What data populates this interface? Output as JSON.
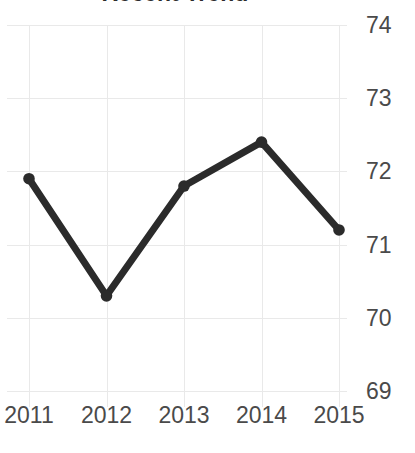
{
  "chart_data": {
    "type": "line",
    "title": "Recent Trend",
    "xlabel": "",
    "ylabel": "",
    "categories": [
      "2011",
      "2012",
      "2013",
      "2014",
      "2015"
    ],
    "values": [
      71.9,
      70.3,
      71.8,
      72.4,
      71.2
    ],
    "series": [
      {
        "name": "Recent Trend",
        "values": [
          71.9,
          70.3,
          71.8,
          72.4,
          71.2
        ]
      }
    ],
    "x_tick_labels": [
      "2011",
      "2012",
      "2013",
      "2014",
      "2015"
    ],
    "y_tick_labels": [
      "74",
      "73",
      "72",
      "71",
      "70",
      "69"
    ],
    "y_ticks": [
      74,
      73,
      72,
      71,
      70,
      69
    ],
    "ylim": [
      69,
      74
    ],
    "grid": true,
    "y_axis_position": "right",
    "legend": "none",
    "marker": "circle",
    "colors": {
      "line": "#2b2b2b",
      "marker": "#2b2b2b",
      "grid": "#e9e9e9",
      "tick_label": "#4a4a4a",
      "title": "#2b2b2b",
      "background": "#ffffff"
    }
  }
}
